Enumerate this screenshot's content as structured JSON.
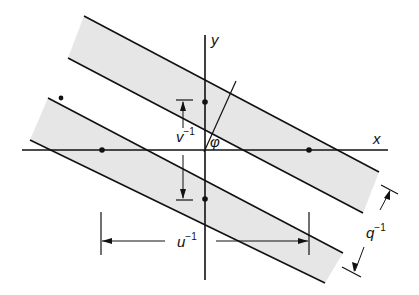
{
  "figure": {
    "colors": {
      "band_fill": "#e6e6e6",
      "line": "#111111",
      "background": "#ffffff"
    },
    "axes": {
      "x_label": "x",
      "y_label": "y"
    },
    "angle_label": "φ",
    "dimensions": {
      "v_inverse": {
        "base": "v",
        "exp": "−1"
      },
      "u_inverse": {
        "base": "u",
        "exp": "−1"
      },
      "q_inverse": {
        "base": "q",
        "exp": "−1"
      }
    },
    "lattice_points": [
      {
        "x": 205,
        "y": 102
      },
      {
        "x": 205,
        "y": 199
      },
      {
        "x": 102,
        "y": 150
      },
      {
        "x": 309,
        "y": 150
      },
      {
        "x": 61,
        "y": 98
      }
    ]
  }
}
